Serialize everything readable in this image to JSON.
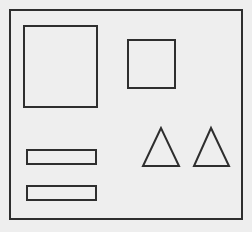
{
  "diagram": {
    "type": "wireframe-sketch",
    "background": "#eeeeee",
    "stroke": "#2e2e2e",
    "frame": {
      "x": 10,
      "y": 10,
      "w": 232,
      "h": 209
    },
    "shapes": [
      {
        "kind": "rect",
        "name": "large-square",
        "x": 24,
        "y": 26,
        "w": 73,
        "h": 81
      },
      {
        "kind": "rect",
        "name": "small-square",
        "x": 128,
        "y": 40,
        "w": 47,
        "h": 48
      },
      {
        "kind": "rect",
        "name": "bar-top",
        "x": 27,
        "y": 150,
        "w": 69,
        "h": 14
      },
      {
        "kind": "rect",
        "name": "bar-bottom",
        "x": 27,
        "y": 186,
        "w": 69,
        "h": 14
      },
      {
        "kind": "triangle",
        "name": "triangle-left",
        "points": "161,128 143,166 179,166"
      },
      {
        "kind": "triangle",
        "name": "triangle-right",
        "points": "211,128 194,166 229,166"
      }
    ]
  }
}
